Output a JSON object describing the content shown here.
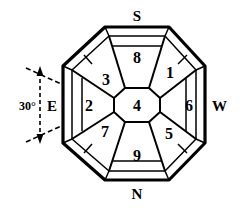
{
  "figure": {
    "type": "octagonal-sector-diagram",
    "title": "",
    "stroke_color": "#000000",
    "fill_color": "#ffffff",
    "background": "#ffffff",
    "compass_labels": {
      "top": "S",
      "bottom": "N",
      "left": "E",
      "right": "W"
    },
    "angle_annotation": {
      "value": "30°",
      "apex": "left-vertex",
      "line_style": "dashed"
    },
    "center_region": {
      "label": "4",
      "shape": "octagon"
    },
    "regions": [
      {
        "label": "1",
        "position": "upper-right",
        "cx": 170,
        "cy": 72
      },
      {
        "label": "2",
        "position": "left",
        "cx": 89,
        "cy": 105
      },
      {
        "label": "3",
        "position": "upper-left",
        "cx": 106,
        "cy": 79
      },
      {
        "label": "4",
        "position": "center",
        "cx": 137,
        "cy": 105
      },
      {
        "label": "5",
        "position": "lower-right",
        "cx": 169,
        "cy": 133
      },
      {
        "label": "6",
        "position": "right",
        "cx": 188,
        "cy": 105
      },
      {
        "label": "7",
        "position": "lower-left",
        "cx": 105,
        "cy": 131
      },
      {
        "label": "8",
        "position": "top",
        "cx": 137,
        "cy": 57
      },
      {
        "label": "9",
        "position": "bottom",
        "cx": 137,
        "cy": 155
      }
    ],
    "outer_ring": {
      "description": "narrow band along each octagon edge",
      "segments": 8
    }
  }
}
